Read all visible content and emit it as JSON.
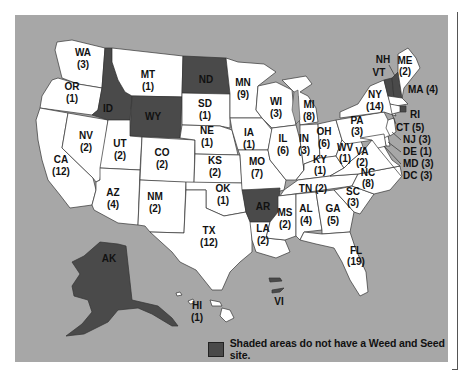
{
  "map": {
    "subject": "Weed and Seed sites by state",
    "shaded_color": "#4a4a4a",
    "unshaded_color": "#ffffff",
    "background_color": "#a7a7a7",
    "legend": {
      "text": "Shaded areas do not have a Weed and Seed site."
    },
    "states": {
      "WA": {
        "abbr": "WA",
        "count": "(3)",
        "shaded": false
      },
      "OR": {
        "abbr": "OR",
        "count": "(1)",
        "shaded": false
      },
      "CA": {
        "abbr": "CA",
        "count": "(12)",
        "shaded": false
      },
      "NV": {
        "abbr": "NV",
        "count": "(2)",
        "shaded": false
      },
      "ID": {
        "abbr": "ID",
        "count": "",
        "shaded": true
      },
      "MT": {
        "abbr": "MT",
        "count": "(1)",
        "shaded": false
      },
      "WY": {
        "abbr": "WY",
        "count": "",
        "shaded": true
      },
      "UT": {
        "abbr": "UT",
        "count": "(2)",
        "shaded": false
      },
      "AZ": {
        "abbr": "AZ",
        "count": "(4)",
        "shaded": false
      },
      "CO": {
        "abbr": "CO",
        "count": "(2)",
        "shaded": false
      },
      "NM": {
        "abbr": "NM",
        "count": "(2)",
        "shaded": false
      },
      "ND": {
        "abbr": "ND",
        "count": "",
        "shaded": true
      },
      "SD": {
        "abbr": "SD",
        "count": "(1)",
        "shaded": false
      },
      "NE": {
        "abbr": "NE",
        "count": "(1)",
        "shaded": false
      },
      "KS": {
        "abbr": "KS",
        "count": "(2)",
        "shaded": false
      },
      "OK": {
        "abbr": "OK",
        "count": "(1)",
        "shaded": false
      },
      "TX": {
        "abbr": "TX",
        "count": "(12)",
        "shaded": false
      },
      "MN": {
        "abbr": "MN",
        "count": "(9)",
        "shaded": false
      },
      "IA": {
        "abbr": "IA",
        "count": "(1)",
        "shaded": false
      },
      "MO": {
        "abbr": "MO",
        "count": "(7)",
        "shaded": false
      },
      "AR": {
        "abbr": "AR",
        "count": "",
        "shaded": true
      },
      "LA": {
        "abbr": "LA",
        "count": "(2)",
        "shaded": false
      },
      "WI": {
        "abbr": "WI",
        "count": "(3)",
        "shaded": false
      },
      "IL": {
        "abbr": "IL",
        "count": "(6)",
        "shaded": false
      },
      "MI": {
        "abbr": "MI",
        "count": "(8)",
        "shaded": false
      },
      "IN": {
        "abbr": "IN",
        "count": "(3)",
        "shaded": false
      },
      "OH": {
        "abbr": "OH",
        "count": "(6)",
        "shaded": false
      },
      "KY": {
        "abbr": "KY",
        "count": "(1)",
        "shaded": false
      },
      "TN": {
        "abbr": "TN",
        "count": "(2)",
        "shaded": false
      },
      "MS": {
        "abbr": "MS",
        "count": "(2)",
        "shaded": false
      },
      "AL": {
        "abbr": "AL",
        "count": "(4)",
        "shaded": false
      },
      "GA": {
        "abbr": "GA",
        "count": "(5)",
        "shaded": false
      },
      "FL": {
        "abbr": "FL",
        "count": "(19)",
        "shaded": false
      },
      "SC": {
        "abbr": "SC",
        "count": "(3)",
        "shaded": false
      },
      "NC": {
        "abbr": "NC",
        "count": "(8)",
        "shaded": false
      },
      "VA": {
        "abbr": "VA",
        "count": "(2)",
        "shaded": false
      },
      "WV": {
        "abbr": "WV",
        "count": "(1)",
        "shaded": false
      },
      "PA": {
        "abbr": "PA",
        "count": "(3)",
        "shaded": false
      },
      "NY": {
        "abbr": "NY",
        "count": "(14)",
        "shaded": false
      },
      "VT": {
        "abbr": "VT",
        "count": "",
        "shaded": true
      },
      "NH": {
        "abbr": "NH",
        "count": "",
        "shaded": true
      },
      "ME": {
        "abbr": "ME",
        "count": "(2)",
        "shaded": false
      },
      "MA": {
        "abbr": "MA",
        "count": "(4)",
        "shaded": false,
        "label": "MA (4)"
      },
      "RI": {
        "abbr": "RI",
        "count": "",
        "shaded": true
      },
      "CT": {
        "abbr": "CT",
        "count": "(5)",
        "shaded": false,
        "label": "CT (5)"
      },
      "NJ": {
        "abbr": "NJ",
        "count": "(3)",
        "shaded": false,
        "label": "NJ (3)"
      },
      "DE": {
        "abbr": "DE",
        "count": "(1)",
        "shaded": false,
        "label": "DE (1)"
      },
      "MD": {
        "abbr": "MD",
        "count": "(3)",
        "shaded": false,
        "label": "MD (3)"
      },
      "DC": {
        "abbr": "DC",
        "count": "(3)",
        "shaded": false,
        "label": "DC (3)"
      },
      "TN_label": "TN (2)",
      "AK": {
        "abbr": "AK",
        "count": "",
        "shaded": true
      },
      "HI": {
        "abbr": "HI",
        "count": "(1)",
        "shaded": false
      },
      "VI": {
        "abbr": "VI",
        "count": "",
        "shaded": true
      }
    }
  }
}
